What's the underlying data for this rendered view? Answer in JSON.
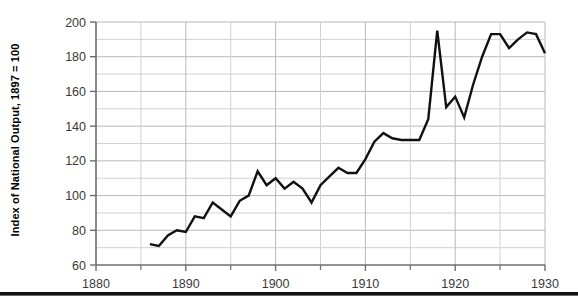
{
  "axes": {
    "ylabel": "Index of National Output, 1897 = 100",
    "ytick_labels": [
      "200",
      "180",
      "160",
      "140",
      "120",
      "100",
      "80",
      "60"
    ],
    "xtick_labels": [
      "1880",
      "1890",
      "1900",
      "1910",
      "1920",
      "1930"
    ]
  },
  "colors": {
    "line": "#111111",
    "grid": "#b9b9b9",
    "minor_grid": "#d2d2d2",
    "axis": "#6e6e6e",
    "tick_text": "#3a3a3a",
    "label_text": "#000000",
    "background": "#ffffff",
    "rule": "#141414"
  },
  "chart_data": {
    "type": "line",
    "title": "",
    "xlabel": "",
    "ylabel": "Index of National Output, 1897 = 100",
    "xlim": [
      1880,
      1930
    ],
    "ylim": [
      60,
      200
    ],
    "ytick_values": [
      60,
      80,
      100,
      120,
      140,
      160,
      180,
      200
    ],
    "ytick_minor_step": 10,
    "xtick_values": [
      1880,
      1890,
      1900,
      1910,
      1920,
      1930
    ],
    "xtick_minor_step": 5,
    "grid": true,
    "legend": null,
    "series": [
      {
        "name": "Index of National Output",
        "x": [
          1886,
          1887,
          1888,
          1889,
          1890,
          1891,
          1892,
          1893,
          1894,
          1895,
          1896,
          1897,
          1898,
          1899,
          1900,
          1901,
          1902,
          1903,
          1904,
          1905,
          1906,
          1907,
          1908,
          1909,
          1910,
          1911,
          1912,
          1913,
          1914,
          1915,
          1916,
          1917,
          1918,
          1919,
          1920,
          1921,
          1922,
          1923,
          1924,
          1925,
          1926,
          1927,
          1928,
          1929,
          1930
        ],
        "values": [
          72,
          71,
          77,
          80,
          79,
          88,
          87,
          96,
          92,
          88,
          97,
          100,
          114,
          106,
          110,
          104,
          108,
          104,
          96,
          106,
          111,
          116,
          113,
          113,
          121,
          131,
          136,
          133,
          132,
          132,
          132,
          144,
          195,
          151,
          157,
          145,
          164,
          180,
          193,
          193,
          185,
          190,
          194,
          193,
          182
        ]
      }
    ]
  }
}
